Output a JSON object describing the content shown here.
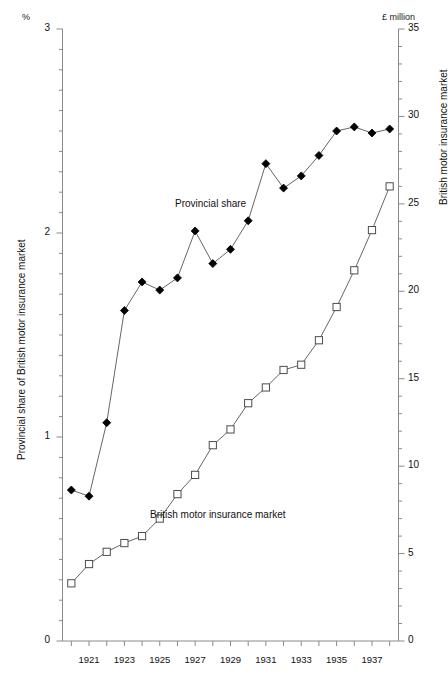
{
  "chart_data": {
    "type": "line",
    "title": "",
    "xlabel": "",
    "ylabel": "Provincial share of British motor insurance market",
    "ylabel_right": "British motor insurance market",
    "unit_left": "%",
    "unit_right": "£ million",
    "xlim": [
      1919.5,
      1938.5
    ],
    "ylim": [
      0,
      3
    ],
    "ylim_right": [
      0,
      35
    ],
    "grid": false,
    "legend_position": "inline-annotations",
    "x": [
      1920,
      1921,
      1922,
      1923,
      1924,
      1925,
      1926,
      1927,
      1928,
      1929,
      1930,
      1931,
      1932,
      1933,
      1934,
      1935,
      1936,
      1937,
      1938
    ],
    "xtick_labels": [
      "1921",
      "1923",
      "1925",
      "1927",
      "1929",
      "1931",
      "1933",
      "1935",
      "1937"
    ],
    "xtick_values": [
      1921,
      1923,
      1925,
      1927,
      1929,
      1931,
      1933,
      1935,
      1937
    ],
    "ytick_labels_left": [
      "0",
      "1",
      "2",
      "3"
    ],
    "ytick_values_left": [
      0,
      1,
      2,
      3
    ],
    "ytick_labels_right": [
      "0",
      "5",
      "10",
      "15",
      "20",
      "25",
      "30",
      "35"
    ],
    "ytick_values_right": [
      0,
      5,
      10,
      15,
      20,
      25,
      30,
      35
    ],
    "series": [
      {
        "name": "Provincial share",
        "marker": "filled-diamond",
        "axis": "left",
        "values": [
          0.74,
          0.71,
          1.07,
          1.62,
          1.76,
          1.72,
          1.78,
          2.01,
          1.85,
          1.92,
          2.06,
          2.34,
          2.22,
          2.28,
          2.38,
          2.5,
          2.52,
          2.49,
          2.51
        ]
      },
      {
        "name": "British motor insurance market",
        "marker": "open-square",
        "axis": "right",
        "values": [
          3.3,
          4.4,
          5.1,
          5.6,
          6.0,
          7.0,
          8.4,
          9.5,
          11.2,
          12.1,
          13.6,
          14.5,
          15.5,
          15.8,
          17.2,
          19.1,
          21.2,
          23.5,
          26.0
        ]
      }
    ],
    "annotations": [
      {
        "text": "Provincial share",
        "x": 1924.9,
        "y": 2.17
      },
      {
        "text": "British motor insurance market",
        "x": 1923.6,
        "y": 0.62
      }
    ]
  }
}
